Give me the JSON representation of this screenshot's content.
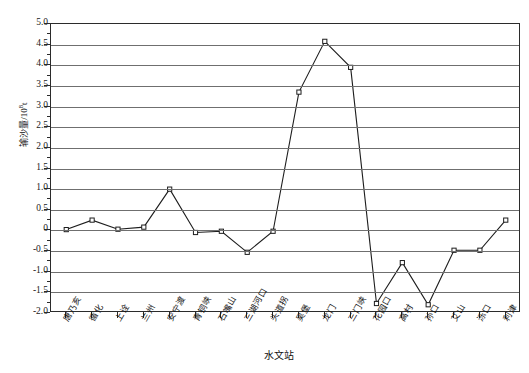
{
  "chart_data": {
    "type": "line",
    "title": "",
    "xlabel": "水文站",
    "ylabel": "输沙量/10⁸t",
    "ylabel_base": "输沙量/10",
    "ylabel_sup": "8",
    "ylabel_unit": "t",
    "ylim": [
      -2.0,
      5.0
    ],
    "ytick_step": 0.5,
    "yticks": [
      5.0,
      4.5,
      4.0,
      3.5,
      3.0,
      2.5,
      2.0,
      1.5,
      1.0,
      0.5,
      0,
      -0.5,
      -1.0,
      -1.5,
      -2.0
    ],
    "ytick_labels": [
      "5.0",
      "4.5",
      "4.0",
      "3.5",
      "3.0",
      "2.5",
      "2.0",
      "1.5",
      "1.0",
      "0.5",
      "0",
      "-0.5",
      "-1.0",
      "-1.5",
      "-2.0"
    ],
    "grid": true,
    "grid_axis": "y",
    "legend": false,
    "marker": "open-square",
    "line_color": "#1d1d1d",
    "grid_color": "#6f6f6f",
    "frame_color": "#2b2b2b",
    "categories": [
      "唐乃亥",
      "循化",
      "上诠",
      "兰州",
      "安宁渡",
      "青铜峡",
      "石嘴山",
      "三湖河口",
      "头道拐",
      "吴堡",
      "龙门",
      "三门峡",
      "花园口",
      "高村",
      "孙口",
      "艾山",
      "泺口",
      "利津"
    ],
    "values": [
      0.02,
      0.25,
      0.03,
      0.08,
      1.0,
      -0.05,
      -0.02,
      -0.53,
      -0.02,
      3.35,
      4.58,
      3.95,
      -1.77,
      -0.78,
      -1.8,
      -0.48,
      -0.48,
      0.25
    ],
    "series": [
      {
        "name": "输沙量",
        "values": [
          0.02,
          0.25,
          0.03,
          0.08,
          1.0,
          -0.05,
          -0.02,
          -0.53,
          -0.02,
          3.35,
          4.58,
          3.95,
          -1.77,
          -0.78,
          -1.8,
          -0.48,
          -0.48,
          0.25
        ]
      }
    ]
  }
}
